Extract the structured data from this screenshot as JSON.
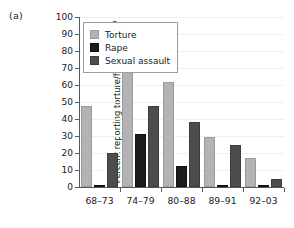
{
  "panel": {
    "label": "(a)"
  },
  "axis_title": {
    "line1": "Percent reporting torture/forcible rape/",
    "line2": "sexual assault who are Kurds"
  },
  "legend": {
    "position": "top-left-inside",
    "items": [
      {
        "label": "Torture",
        "color": "#b3b3b3",
        "swatch": "torture-swatch"
      },
      {
        "label": "Rape",
        "color": "#1c1c1c",
        "swatch": "rape-swatch"
      },
      {
        "label": "Sexual assault",
        "color": "#4d4d4d",
        "swatch": "sexual-assault-swatch"
      }
    ]
  },
  "yaxis": {
    "ticks": [
      "0",
      "10",
      "20",
      "30",
      "40",
      "50",
      "60",
      "70",
      "80",
      "90",
      "100"
    ]
  },
  "chart_data": {
    "type": "bar",
    "title": "(a)",
    "xlabel": "",
    "ylabel": "Percent reporting torture/forcible rape/ sexual assault who are Kurds",
    "ylim": [
      0,
      100
    ],
    "ytick_step": 10,
    "grid": true,
    "legend_position": "top-left-inside",
    "categories": [
      "68–73",
      "74–79",
      "80–88",
      "89–91",
      "92–03"
    ],
    "series": [
      {
        "name": "Torture",
        "color": "#b3b3b3",
        "values": [
          47.5,
          70,
          62,
          29.5,
          17
        ]
      },
      {
        "name": "Rape",
        "color": "#1c1c1c",
        "values": [
          1,
          31,
          12.5,
          1,
          1
        ]
      },
      {
        "name": "Sexual assault",
        "color": "#4d4d4d",
        "values": [
          20,
          47.5,
          38.5,
          24.5,
          5
        ]
      }
    ]
  }
}
